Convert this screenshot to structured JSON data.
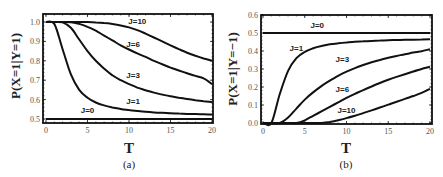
{
  "chart_data": [
    {
      "type": "line",
      "panel": "(a)",
      "title": "",
      "xlabel": "T",
      "ylabel": "P(X=1|Y=1)",
      "xlim": [
        0,
        20
      ],
      "ylim": [
        0.48,
        1.04
      ],
      "xticks": [
        "0",
        "5",
        "10",
        "15",
        "20"
      ],
      "yticks": [
        "0.5",
        "0.6",
        "0.7",
        "0.8",
        "0.9",
        "1.0"
      ],
      "grid": false,
      "legend": "inline curve labels",
      "x": [
        0,
        1,
        2,
        3,
        4,
        5,
        6,
        7,
        8,
        9,
        10,
        11,
        12,
        13,
        14,
        15,
        16,
        17,
        18,
        19,
        20
      ],
      "series": [
        {
          "name": "J=0",
          "label_pos": [
            5,
            0.53
          ],
          "values": [
            0.5,
            0.5,
            0.5,
            0.5,
            0.5,
            0.5,
            0.5,
            0.5,
            0.5,
            0.5,
            0.5,
            0.5,
            0.5,
            0.5,
            0.5,
            0.5,
            0.5,
            0.5,
            0.5,
            0.5,
            0.5
          ]
        },
        {
          "name": "J=1",
          "label_pos": [
            10.5,
            0.575
          ],
          "values": [
            1.0,
            0.99,
            0.86,
            0.73,
            0.65,
            0.61,
            0.585,
            0.57,
            0.56,
            0.552,
            0.546,
            0.541,
            0.537,
            0.534,
            0.532,
            0.53,
            0.528,
            0.526,
            0.525,
            0.524,
            0.523
          ]
        },
        {
          "name": "J=3",
          "label_pos": [
            10.5,
            0.71
          ],
          "values": [
            1.0,
            1.0,
            0.998,
            0.97,
            0.91,
            0.85,
            0.8,
            0.76,
            0.725,
            0.7,
            0.68,
            0.662,
            0.648,
            0.636,
            0.626,
            0.617,
            0.61,
            0.603,
            0.597,
            0.592,
            0.588
          ]
        },
        {
          "name": "J=6",
          "label_pos": [
            10.5,
            0.87
          ],
          "values": [
            1.0,
            1.0,
            1.0,
            0.999,
            0.99,
            0.975,
            0.955,
            0.93,
            0.905,
            0.88,
            0.858,
            0.838,
            0.82,
            0.8,
            0.782,
            0.765,
            0.75,
            0.736,
            0.722,
            0.71,
            0.68
          ]
        },
        {
          "name": "J=10",
          "label_pos": [
            11,
            0.99
          ],
          "values": [
            1.0,
            1.0,
            1.0,
            1.0,
            1.0,
            1.0,
            0.998,
            0.995,
            0.99,
            0.982,
            0.972,
            0.958,
            0.94,
            0.92,
            0.9,
            0.88,
            0.86,
            0.842,
            0.826,
            0.812,
            0.8
          ]
        }
      ]
    },
    {
      "type": "line",
      "panel": "(b)",
      "title": "",
      "xlabel": "T",
      "ylabel": "P(X=1|Y=−1)",
      "xlim": [
        0,
        20
      ],
      "ylim": [
        0.0,
        0.6
      ],
      "xticks": [
        "0",
        "5",
        "10",
        "15",
        "20"
      ],
      "yticks": [
        "0.0",
        "0.1",
        "0.2",
        "0.3",
        "0.4",
        "0.5",
        "0.6"
      ],
      "grid": false,
      "legend": "inline curve labels",
      "x": [
        0,
        1,
        2,
        3,
        4,
        5,
        6,
        7,
        8,
        9,
        10,
        11,
        12,
        13,
        14,
        15,
        16,
        17,
        18,
        19,
        20
      ],
      "series": [
        {
          "name": "J=0",
          "label_pos": [
            6.5,
            0.53
          ],
          "values": [
            0.5,
            0.5,
            0.5,
            0.5,
            0.5,
            0.5,
            0.5,
            0.5,
            0.5,
            0.5,
            0.5,
            0.5,
            0.5,
            0.5,
            0.5,
            0.5,
            0.5,
            0.5,
            0.5,
            0.5,
            0.5
          ]
        },
        {
          "name": "J=1",
          "label_pos": [
            4,
            0.4
          ],
          "values": [
            0.0,
            0.0,
            0.16,
            0.29,
            0.36,
            0.395,
            0.415,
            0.428,
            0.437,
            0.443,
            0.448,
            0.451,
            0.454,
            0.456,
            0.458,
            0.46,
            0.461,
            0.462,
            0.463,
            0.464,
            0.465
          ]
        },
        {
          "name": "J=3",
          "label_pos": [
            9.5,
            0.34
          ],
          "values": [
            0.0,
            0.0,
            0.0,
            0.03,
            0.08,
            0.13,
            0.17,
            0.205,
            0.235,
            0.262,
            0.285,
            0.305,
            0.322,
            0.337,
            0.35,
            0.362,
            0.373,
            0.382,
            0.391,
            0.399,
            0.41
          ]
        },
        {
          "name": "J=6",
          "label_pos": [
            9.5,
            0.17
          ],
          "values": [
            0.0,
            0.0,
            0.0,
            0.0,
            0.0,
            0.015,
            0.04,
            0.065,
            0.09,
            0.115,
            0.14,
            0.162,
            0.183,
            0.203,
            0.222,
            0.24,
            0.256,
            0.271,
            0.286,
            0.3,
            0.312
          ]
        },
        {
          "name": "J=10",
          "label_pos": [
            10,
            0.055
          ],
          "values": [
            0.0,
            0.0,
            0.0,
            0.0,
            0.0,
            0.0,
            0.0,
            0.0,
            0.005,
            0.015,
            0.027,
            0.04,
            0.055,
            0.07,
            0.086,
            0.102,
            0.118,
            0.134,
            0.15,
            0.167,
            0.19
          ]
        }
      ]
    }
  ],
  "panels": {
    "a": {
      "caption": "(a)",
      "xlabel": "T",
      "ylabel": "P(X=1|Y=1)"
    },
    "b": {
      "caption": "(b)",
      "xlabel": "T",
      "ylabel": "P(X=1|Y=−1)"
    }
  },
  "colors": {
    "line": "#111111",
    "frame": "#111111",
    "tick_text": "#555555"
  }
}
